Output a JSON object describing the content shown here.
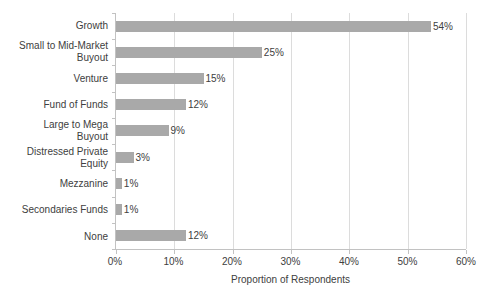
{
  "chart_data": {
    "type": "bar",
    "orientation": "horizontal",
    "title": "",
    "categories": [
      "Growth",
      "Small to Mid-Market\nBuyout",
      "Venture",
      "Fund of Funds",
      "Large to Mega\nBuyout",
      "Distressed Private\nEquity",
      "Mezzanine",
      "Secondaries Funds",
      "None"
    ],
    "values": [
      54,
      25,
      15,
      12,
      9,
      3,
      1,
      1,
      12
    ],
    "value_labels": [
      "54%",
      "25%",
      "15%",
      "12%",
      "9%",
      "3%",
      "1%",
      "1%",
      "12%"
    ],
    "xlabel": "Proportion of Respondents",
    "ylabel": "",
    "xlim": [
      0,
      60
    ],
    "x_ticks": [
      0,
      10,
      20,
      30,
      40,
      50,
      60
    ],
    "x_tick_labels": [
      "0%",
      "10%",
      "20%",
      "30%",
      "40%",
      "50%",
      "60%"
    ],
    "grid": "vertical",
    "legend": "none",
    "colors": {
      "bar": "#a9a9a9",
      "gridline": "#dcdcdc",
      "axis": "#c2c2c2",
      "text": "#404040",
      "background": "#ffffff"
    }
  }
}
